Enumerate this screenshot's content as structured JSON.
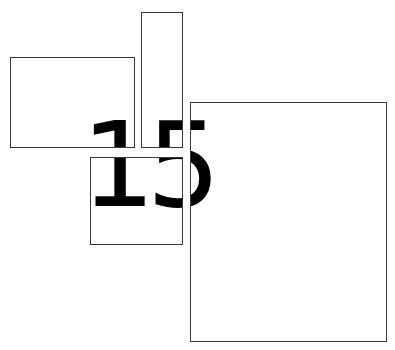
{
  "figure": {
    "text": "15",
    "text_color": "#000000",
    "border_color": "#3a3a3a",
    "background": "#ffffff",
    "text_origin": {
      "x": 81,
      "y": 107
    },
    "boxes": [
      {
        "id": "box-1",
        "x": 10,
        "y": 57,
        "w": 125,
        "h": 91
      },
      {
        "id": "box-2",
        "x": 141,
        "y": 12,
        "w": 42,
        "h": 136
      },
      {
        "id": "box-3",
        "x": 90,
        "y": 157,
        "w": 93,
        "h": 88
      },
      {
        "id": "box-4",
        "x": 190,
        "y": 102,
        "w": 197,
        "h": 240
      }
    ]
  }
}
